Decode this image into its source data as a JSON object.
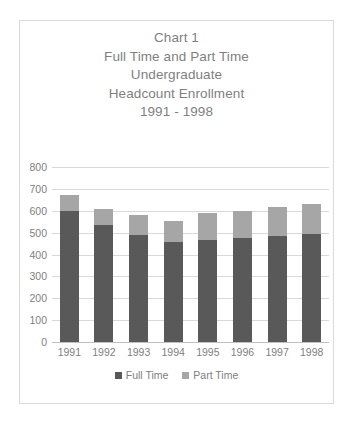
{
  "chart_data": {
    "type": "bar",
    "subtype": "stacked-column",
    "title": "Chart 1\nFull Time and Part Time\nUndergraduate\nHeadcount Enrollment\n1991 - 1998",
    "title_lines": [
      "Chart 1",
      "Full Time and Part Time",
      "Undergraduate",
      "Headcount Enrollment",
      "1991 - 1998"
    ],
    "categories": [
      "1991",
      "1992",
      "1993",
      "1994",
      "1995",
      "1996",
      "1997",
      "1998"
    ],
    "series": [
      {
        "name": "Full Time",
        "color": "#595959",
        "values": [
          600,
          535,
          490,
          455,
          465,
          475,
          485,
          495
        ]
      },
      {
        "name": "Part Time",
        "color": "#a6a6a6",
        "values": [
          70,
          75,
          90,
          100,
          125,
          125,
          130,
          135
        ]
      }
    ],
    "totals": [
      670,
      610,
      580,
      555,
      590,
      600,
      615,
      630
    ],
    "xlabel": "",
    "ylabel": "",
    "ylim": [
      0,
      800
    ],
    "ytick_values": [
      0,
      100,
      200,
      300,
      400,
      500,
      600,
      700,
      800
    ],
    "ytick_labels": [
      "0",
      "100",
      "200",
      "300",
      "400",
      "500",
      "600",
      "700",
      "800"
    ],
    "grid": "horizontal",
    "legend_position": "bottom",
    "legend_entries": [
      "Full Time",
      "Part Time"
    ],
    "axis_color": "#808080",
    "grid_color": "#d9d9d9",
    "border_color": "#d9d9d9"
  }
}
